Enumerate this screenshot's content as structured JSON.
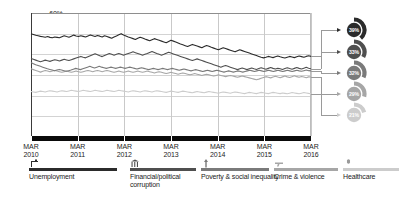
{
  "chart_data": {
    "type": "line",
    "title": "",
    "xlabel": "",
    "ylabel": "",
    "ylim": [
      0,
      60
    ],
    "ytick_labels": [
      "60%",
      "50%",
      "40%",
      "30%",
      "20%",
      "10%",
      "0%"
    ],
    "ytick_values": [
      60,
      50,
      40,
      30,
      20,
      10,
      0
    ],
    "grid": true,
    "legend_position": "bottom",
    "x_tick_labels": [
      {
        "month": "MAR",
        "year": "2010"
      },
      {
        "month": "MAR",
        "year": "2011"
      },
      {
        "month": "MAR",
        "year": "2012"
      },
      {
        "month": "MAR",
        "year": "2013"
      },
      {
        "month": "MAR",
        "year": "2014"
      },
      {
        "month": "MAR",
        "year": "2015"
      },
      {
        "month": "MAR",
        "year": "2016"
      }
    ],
    "x_range": [
      "MAR 2010",
      "MAR 2016"
    ],
    "series": [
      {
        "name": "Unemployment",
        "color": "#2b2b2b",
        "end_value": 39,
        "end_label": "39%",
        "values": [
          50,
          49.6,
          49.2,
          49,
          48.7,
          48.5,
          48.3,
          48.6,
          48.2,
          48,
          48.4,
          48.2,
          48,
          48.5,
          49,
          48.6,
          48.3,
          48.8,
          49.3,
          48.9,
          48.6,
          49,
          48.7,
          48.4,
          48.9,
          49.4,
          49,
          48.6,
          49.1,
          48.8,
          48.4,
          49,
          48.6,
          48.2,
          47.8,
          48.4,
          48.9,
          49.5,
          50,
          49.4,
          48.9,
          48.4,
          48,
          47.6,
          47.2,
          47.8,
          48.3,
          47.9,
          47.4,
          47,
          46.6,
          47.1,
          47.6,
          47.2,
          46.8,
          46.4,
          46,
          45.6,
          46.2,
          46.8,
          46.4,
          46,
          45.5,
          45,
          44.6,
          44.2,
          43.8,
          44.3,
          44.8,
          44.4,
          44,
          43.6,
          43.2,
          43.8,
          44.3,
          43.9,
          43.4,
          43,
          42.6,
          42.2,
          42.7,
          43.2,
          42.8,
          42.4,
          42,
          41.6,
          41.2,
          41.7,
          42.2,
          41.8,
          41.4,
          41,
          40.6,
          40.2,
          39.8,
          39.4,
          39,
          38.6,
          38.3,
          38.6,
          39,
          38.7,
          38.4,
          38.8,
          39.2,
          38.8,
          38.5,
          38.2,
          38.6,
          39,
          38.7,
          38.4,
          38.8,
          39.2,
          38.9,
          38.6,
          39,
          39.3,
          39
        ]
      },
      {
        "name": "Financial/political corruption",
        "color": "#4f4f4f",
        "end_value": 33,
        "end_label": "33%",
        "values": [
          38,
          37.6,
          37.2,
          36.8,
          36.4,
          36.8,
          37.2,
          36.9,
          36.6,
          37,
          37.4,
          37.1,
          36.8,
          37.2,
          37.6,
          37.3,
          37,
          37.4,
          37.8,
          38.2,
          38.6,
          39,
          38.6,
          38.3,
          38.8,
          39.3,
          39.8,
          40.3,
          39.8,
          39.3,
          38.9,
          39.4,
          39.9,
          40.4,
          40,
          39.6,
          40,
          40.4,
          40,
          39.6,
          40,
          40.4,
          40.8,
          41.2,
          40.8,
          40.4,
          40,
          39.6,
          40,
          40.4,
          40.9,
          41.4,
          40.9,
          40.4,
          40,
          39.6,
          40,
          40.5,
          41,
          40.6,
          40.2,
          39.8,
          39.4,
          39,
          38.6,
          38.2,
          37.8,
          37.4,
          37,
          37.4,
          37.8,
          37.4,
          37,
          36.6,
          36.2,
          35.8,
          35.4,
          35,
          34.6,
          34.2,
          33.8,
          34.2,
          34.6,
          34.2,
          33.8,
          33.4,
          33,
          32.6,
          33,
          33.4,
          33,
          32.6,
          33,
          33.4,
          33,
          32.7,
          33.1,
          33.5,
          33.1,
          32.8,
          33.2,
          33.6,
          33.2,
          32.9,
          33.3,
          33,
          32.7,
          33.1,
          33.5,
          33.1,
          32.8,
          33.2,
          33.6,
          33.2,
          32.9,
          33.3,
          33.7,
          33.3,
          33
        ]
      },
      {
        "name": "Poverty & social inequality",
        "color": "#7a7a7a",
        "end_value": 32,
        "end_label": "32%",
        "values": [
          36,
          35.5,
          35,
          34.6,
          34.2,
          33.8,
          33.4,
          33,
          32.7,
          32.4,
          32.1,
          32.4,
          32.7,
          32.4,
          32.1,
          31.8,
          32.1,
          32.4,
          32.8,
          33.2,
          32.9,
          32.6,
          33,
          33.4,
          33.8,
          34.2,
          33.8,
          33.4,
          33.8,
          34.2,
          33.8,
          33.5,
          33.2,
          33.5,
          33.8,
          33.5,
          33.2,
          33.5,
          33.8,
          33.5,
          33.2,
          33.5,
          33.8,
          33.5,
          33.2,
          32.9,
          33.2,
          33.5,
          33.2,
          32.9,
          32.6,
          32.9,
          33.2,
          32.9,
          32.6,
          32.9,
          33.2,
          32.9,
          32.6,
          32.9,
          33.2,
          32.9,
          32.6,
          32.3,
          32.6,
          32.9,
          32.6,
          32.3,
          32,
          32.3,
          32.6,
          32.3,
          32,
          31.7,
          32,
          32.3,
          32,
          31.7,
          32,
          32.3,
          32,
          31.7,
          31.4,
          31.7,
          32,
          31.7,
          31.4,
          31.7,
          32,
          31.7,
          31.4,
          31.7,
          32,
          32.3,
          32,
          31.7,
          32,
          32.3,
          32,
          31.7,
          32,
          32.3,
          32,
          31.7,
          32,
          32.3,
          32,
          31.7,
          32,
          32.3,
          32,
          31.7,
          32,
          32.3,
          32,
          31.8,
          32.1,
          32.4,
          32.1,
          32
        ]
      },
      {
        "name": "Crime & violence",
        "color": "#a6a6a6",
        "end_value": 29,
        "end_label": "29%",
        "values": [
          33,
          32.6,
          32.2,
          31.8,
          31.4,
          31.8,
          32.2,
          31.9,
          31.6,
          31.9,
          32.2,
          31.9,
          31.6,
          31.3,
          31.6,
          31.9,
          31.6,
          31.3,
          31.6,
          31.9,
          31.6,
          31.3,
          31.6,
          31.9,
          32.2,
          31.9,
          31.6,
          31.9,
          32.2,
          31.9,
          31.6,
          31.9,
          32.2,
          31.9,
          31.6,
          31.3,
          31.6,
          31.9,
          31.6,
          31.3,
          31.6,
          31.9,
          31.6,
          31.3,
          31.6,
          31.9,
          31.6,
          31.3,
          31.6,
          31.9,
          31.6,
          31.3,
          31,
          31.3,
          31.6,
          31.3,
          31,
          30.7,
          31,
          31.3,
          31,
          30.7,
          30.4,
          30.7,
          31,
          30.7,
          30.4,
          30.1,
          30.4,
          30.7,
          30.4,
          30.1,
          29.8,
          30.1,
          30.4,
          30.1,
          29.8,
          29.5,
          29.8,
          30.1,
          29.8,
          29.5,
          29.2,
          29.5,
          29.8,
          29.5,
          29.2,
          28.9,
          29.2,
          29.5,
          29.2,
          28.9,
          28.6,
          28.3,
          28,
          27.7,
          28,
          28.4,
          28.8,
          29.2,
          28.9,
          28.6,
          29,
          29.4,
          29,
          28.7,
          29.1,
          29.5,
          29.1,
          28.8,
          29.2,
          29.6,
          29.2,
          28.9,
          29.3,
          29,
          28.7,
          29.1,
          29
        ]
      },
      {
        "name": "Healthcare",
        "color": "#cccccc",
        "end_value": 21,
        "end_label": "21%",
        "values": [
          22,
          21.8,
          21.6,
          21.9,
          22.2,
          22,
          21.8,
          22.1,
          22.4,
          22.2,
          22,
          21.8,
          22.1,
          22.4,
          22.2,
          22,
          22.3,
          22.6,
          22.4,
          22.2,
          22,
          22.3,
          22.6,
          22.4,
          22.2,
          22,
          22.3,
          22.6,
          22.4,
          22.2,
          22,
          22.3,
          22.6,
          22.4,
          22.2,
          22,
          22.3,
          22.6,
          22.4,
          22.2,
          22,
          21.8,
          22.1,
          22.4,
          22.2,
          22,
          21.8,
          22.1,
          22.4,
          22.2,
          22,
          21.8,
          22.1,
          22.4,
          22.2,
          22,
          21.8,
          21.6,
          21.9,
          22.2,
          22,
          21.8,
          21.6,
          21.9,
          22.2,
          22,
          21.8,
          21.6,
          21.4,
          21.7,
          22,
          21.8,
          21.6,
          21.4,
          21.7,
          22,
          21.8,
          21.6,
          21.4,
          21.2,
          21.5,
          21.8,
          21.6,
          21.4,
          21.2,
          21.5,
          21.8,
          21.6,
          21.4,
          21.2,
          21,
          21.3,
          21.6,
          21.4,
          21.2,
          21,
          21.3,
          21.6,
          21.4,
          21.2,
          21,
          21.3,
          21.6,
          21.4,
          21.2,
          21,
          21.3,
          21.1,
          20.9,
          21.2,
          21.5,
          21.3,
          21.1,
          20.9,
          21.2,
          21.5,
          21.3,
          21.1,
          21
        ]
      }
    ]
  },
  "legend": {
    "items": [
      {
        "label": "Unemployment",
        "icon": "briefcase-person-icon",
        "color": "#2b2b2b"
      },
      {
        "label": "Financial/political corruption",
        "icon": "bank-building-icon",
        "color": "#4f4f4f"
      },
      {
        "label": "Poverty & social inequality",
        "icon": "person-arrow-icon",
        "color": "#7a7a7a"
      },
      {
        "label": "Crime & violence",
        "icon": "gun-icon",
        "color": "#a6a6a6"
      },
      {
        "label": "Healthcare",
        "icon": "pill-icon",
        "color": "#cccccc"
      }
    ]
  }
}
